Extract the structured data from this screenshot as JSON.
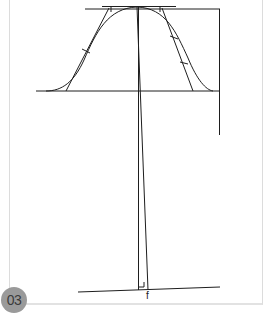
{
  "figure": {
    "number_badge": "03",
    "point_label": "f",
    "colors": {
      "line": "#1e1e1e",
      "frame": "#dcdcdc",
      "badge_bg": "#9a9a9a",
      "badge_text": "#3a3a3a"
    }
  }
}
